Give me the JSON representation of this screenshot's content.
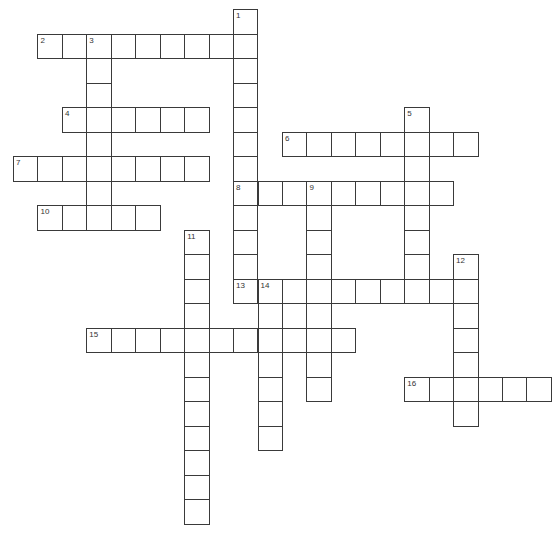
{
  "puzzle": {
    "type": "crossword",
    "grid": {
      "origin_x": 13,
      "origin_y": 9,
      "cell_w": 24.45,
      "cell_h": 24.5,
      "line_color": "#3a3a3a",
      "fill_color": "#ffffff"
    },
    "words": [
      {
        "number": "1",
        "direction": "down",
        "col": 9,
        "row": 0,
        "length": 12
      },
      {
        "number": "2",
        "direction": "across",
        "col": 1,
        "row": 1,
        "length": 9
      },
      {
        "number": "3",
        "direction": "down",
        "col": 3,
        "row": 1,
        "length": 8
      },
      {
        "number": "4",
        "direction": "across",
        "col": 2,
        "row": 4,
        "length": 6
      },
      {
        "number": "5",
        "direction": "down",
        "col": 16,
        "row": 4,
        "length": 8
      },
      {
        "number": "6",
        "direction": "across",
        "col": 11,
        "row": 5,
        "length": 8
      },
      {
        "number": "7",
        "direction": "across",
        "col": 0,
        "row": 6,
        "length": 8
      },
      {
        "number": "8",
        "direction": "across",
        "col": 9,
        "row": 7,
        "length": 9
      },
      {
        "number": "9",
        "direction": "down",
        "col": 12,
        "row": 7,
        "length": 9
      },
      {
        "number": "10",
        "direction": "across",
        "col": 1,
        "row": 8,
        "length": 5
      },
      {
        "number": "11",
        "direction": "down",
        "col": 7,
        "row": 9,
        "length": 12
      },
      {
        "number": "12",
        "direction": "down",
        "col": 18,
        "row": 10,
        "length": 7
      },
      {
        "number": "13",
        "direction": "across",
        "col": 9,
        "row": 11,
        "length": 10
      },
      {
        "number": "14",
        "direction": "down",
        "col": 10,
        "row": 11,
        "length": 7
      },
      {
        "number": "15",
        "direction": "across",
        "col": 3,
        "row": 13,
        "length": 11
      },
      {
        "number": "16",
        "direction": "across",
        "col": 16,
        "row": 15,
        "length": 6
      }
    ]
  }
}
